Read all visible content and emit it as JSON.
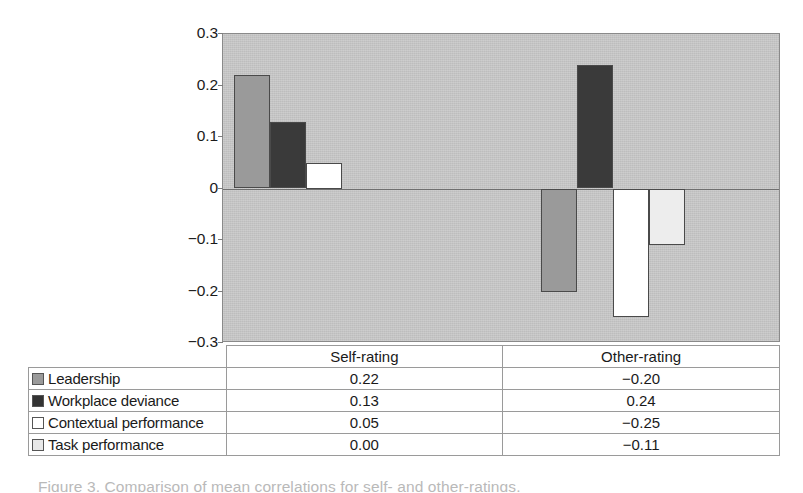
{
  "chart_data": {
    "type": "bar",
    "title": "",
    "subtitle": "",
    "xlabel": "",
    "ylabel": "",
    "categories": [
      "Self-rating",
      "Other-rating"
    ],
    "series": [
      {
        "name": "Leadership",
        "values": [
          0.22,
          -0.2
        ],
        "color": "#9a9a9a",
        "swatch": "#9a9a9a"
      },
      {
        "name": "Workplace deviance",
        "values": [
          0.13,
          0.24
        ],
        "color": "#3a3a3a",
        "swatch": "#333333"
      },
      {
        "name": "Contextual performance",
        "values": [
          0.05,
          -0.25
        ],
        "color": "#ffffff",
        "swatch": "#ffffff"
      },
      {
        "name": "Task performance",
        "values": [
          0.0,
          -0.11
        ],
        "color": "#ededed",
        "swatch": "#e8e8e8"
      }
    ],
    "ylim": [
      -0.3,
      0.3
    ],
    "yticks": [
      0.3,
      0.2,
      0.1,
      0,
      -0.1,
      -0.2,
      -0.3
    ],
    "ytick_labels": [
      "0.3",
      "0.2",
      "0.1",
      "0",
      "−0.1",
      "−0.2",
      "−0.3"
    ],
    "grid": false,
    "zero_line": true,
    "legend_position": "table-below",
    "plot_background": "#bdbdbd"
  },
  "table": {
    "column_headers": [
      "",
      "Self-rating",
      "Other-rating"
    ],
    "rows": [
      {
        "label": "Leadership",
        "self": "0.22",
        "other": "−0.20",
        "swatch": "#9a9a9a"
      },
      {
        "label": "Workplace deviance",
        "self": "0.13",
        "other": "0.24",
        "swatch": "#333333"
      },
      {
        "label": "Contextual performance",
        "self": "0.05",
        "other": "−0.25",
        "swatch": "#ffffff"
      },
      {
        "label": "Task performance",
        "self": "0.00",
        "other": "−0.11",
        "swatch": "#e8e8e8"
      }
    ]
  },
  "caption": {
    "partial_text": "Figure 3. Comparison of mean correlations for self- and other-ratings."
  }
}
